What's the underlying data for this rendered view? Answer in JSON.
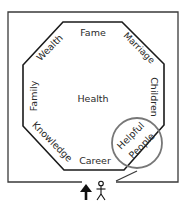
{
  "diagram": {
    "type": "bagua-map",
    "colors": {
      "line": "#1a1a1a",
      "outer_line": "#3a3a3a",
      "text": "#2a2a2a",
      "highlight_circle": "#777777",
      "background": "#ffffff"
    },
    "areas": {
      "top": "Fame",
      "top_left": "Wealth",
      "top_right": "Marriage",
      "left": "Family",
      "center": "Health",
      "right": "Children",
      "bottom_left": "Knowledge",
      "bottom": "Career",
      "bottom_right_line1": "Helpful",
      "bottom_right_line2": "People"
    },
    "highlighted_area": "Helpful People",
    "entrance": {
      "arrow_icon": "up-arrow",
      "person_icon": "stick-figure",
      "door": "open-door-swing"
    }
  }
}
